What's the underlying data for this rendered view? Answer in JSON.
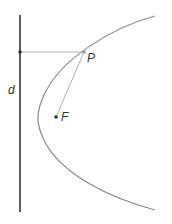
{
  "diagram": {
    "labels": {
      "directrix": "d",
      "point": "P",
      "focus": "F"
    },
    "colors": {
      "directrix": "#333333",
      "curve": "#8a8a8a",
      "segments": "#b0b0b0",
      "text": "#333333"
    }
  }
}
